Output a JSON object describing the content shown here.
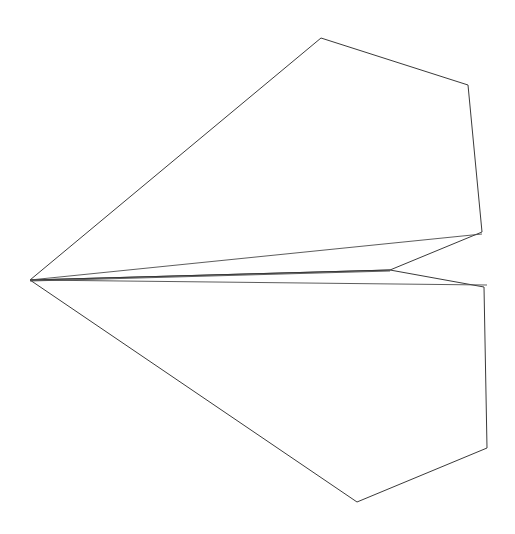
{
  "figure": {
    "background_color": "#ffffff",
    "stroke_color": "#3a3a3a",
    "stroke_width": 1,
    "canvas": {
      "width": 515,
      "height": 534
    }
  },
  "chart_data": {
    "type": "line",
    "xlabel": "",
    "ylabel": "",
    "xlim": [
      0,
      515
    ],
    "ylim": [
      0,
      534
    ],
    "grid": false,
    "legend": "none",
    "annotations": [],
    "vertices": {
      "nose_apex": [
        30,
        280
      ],
      "upper_wing_peak": [
        321,
        38
      ],
      "upper_wing_right_corner": [
        468,
        85
      ],
      "upper_wing_trailing_corner": [
        482,
        232
      ],
      "center_junction": [
        390,
        270
      ],
      "lower_wing_leading_corner": [
        484,
        287
      ],
      "lower_wing_right_corner": [
        487,
        448
      ],
      "lower_wing_bottom_vertex": [
        357,
        502
      ],
      "keel_rear_point": [
        487,
        284
      ],
      "spine_rear_point": [
        482,
        234
      ]
    },
    "series": [
      {
        "name": "upper-wing-outline",
        "closed": false,
        "points": [
          [
            30,
            280
          ],
          [
            321,
            38
          ],
          [
            468,
            85
          ],
          [
            482,
            232
          ],
          [
            390,
            270
          ],
          [
            30,
            280
          ]
        ]
      },
      {
        "name": "lower-wing-outline",
        "closed": false,
        "points": [
          [
            30,
            280
          ],
          [
            390,
            270
          ],
          [
            484,
            287
          ],
          [
            487,
            448
          ],
          [
            357,
            502
          ],
          [
            30,
            280
          ]
        ]
      },
      {
        "name": "upper-spine-fold",
        "closed": false,
        "points": [
          [
            30,
            280
          ],
          [
            482,
            234
          ]
        ]
      },
      {
        "name": "lower-keel-fold",
        "closed": false,
        "points": [
          [
            30,
            280
          ],
          [
            487,
            285
          ]
        ]
      },
      {
        "name": "center-body-fold",
        "closed": false,
        "points": [
          [
            30,
            281
          ],
          [
            390,
            271
          ]
        ]
      }
    ]
  }
}
